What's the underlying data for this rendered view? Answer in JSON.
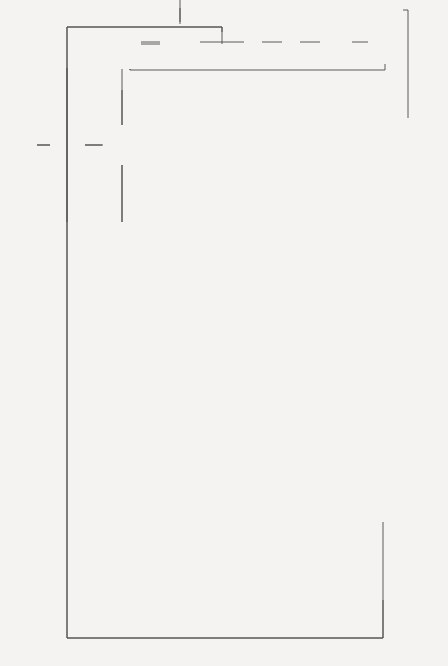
{
  "diagram": {
    "orientation": "rotated 90 degrees counter-clockwise",
    "loops": {
      "j_loop_top": "J loop over N days",
      "j_loop_bottom": "J loop over N days",
      "i_loop": [
        "I loop",
        "for",
        "layers",
        "1-12"
      ],
      "after_n_days": "After N days"
    },
    "boxes": {
      "input": "Input data from files",
      "calc_diff": [
        "Calculate difference (X) between",
        "rainfall and evaporation on day (J)"
      ],
      "calc_w": [
        "Calculate amount of water",
        "(W) available for movement",
        "in layer (I)"
      ],
      "increase_water": [
        "Increase water",
        "content by X in",
        "that layer"
      ],
      "adjust_nitrate": [
        "Adjust the nitrate",
        "content accordingly"
      ],
      "set_field_capacity": [
        "Set water content to",
        "field capacity"
      ],
      "add_excess": [
        "Add excess water to",
        "next layer down"
      ],
      "calc_fraction": [
        "Calculate fraction of water",
        "moved and thus the",
        "amount of nitrate L(I)"
      ],
      "subtract_l": [
        "Subtract L(I) from present",
        "layer nitrate content and",
        "add to next layer down"
      ],
      "calc_evap": [
        "Calculate amount of water",
        "available for evaporation",
        "in each layer S(I)"
      ],
      "find_layer": [
        "Find 1st layer which has",
        "water available [S(I) > 0]"
      ],
      "p9_x": "P9 = X;  I9 = I",
      "use_fno2_a": "Use FNO2",
      "fno2_desc": [
        "FNO2 moves an amount of",
        "water (P9) and the",
        "appropriate amount of nitrate",
        "from the I9th layer to",
        "the surface"
      ],
      "output": "Output statements",
      "p9_s": "P9 = S(I);  I9 = I",
      "use_fno2_b": "Use FNO2",
      "x_minus_s": "X = X − S(I)",
      "i_plus_1": "I = I + 1",
      "print_not_enough": [
        "Print ‘not enough",
        "water available’"
      ]
    },
    "decisions": {
      "x_lt_0": {
        "line1": "Is",
        "line2": "X < 0",
        "yes": "Y",
        "no": "N",
        "yes_label": [
          "Upward",
          "leaching"
        ],
        "no_label": [
          "Downward",
          "leaching"
        ]
      },
      "w_lt_0": {
        "line1": "Is",
        "line2": "W < 0",
        "yes": "Y",
        "no": "N"
      },
      "x_lt_s": {
        "line1": "Is",
        "line2": "X < S(I)",
        "yes": "Y",
        "no": "N"
      },
      "i_gt_n": {
        "line1": "Is",
        "line2": "I > N",
        "yes": "Y",
        "no": "N"
      }
    }
  }
}
